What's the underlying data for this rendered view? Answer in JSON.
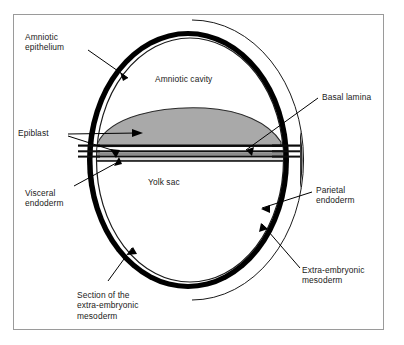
{
  "figure": {
    "kind": "biological-cross-section-diagram",
    "frame": {
      "border_color": "#9a9a9a",
      "background": "#ffffff"
    }
  },
  "colors": {
    "background": "#ffffff",
    "outline": "#000000",
    "mesoderm_hatch_dark": "#4a4a4a",
    "mesoderm_hatch_light": "#6e6e6e",
    "ring_black": "#000000",
    "ring_white": "#ffffff",
    "epiblast_gray": "#a9a9a9",
    "layer_mid_gray": "#8c8c8c",
    "label_text": "#1a1a1a",
    "leader_line": "#000000"
  },
  "interior_labels": [
    {
      "id": "amniotic-cavity",
      "text": "Amniotic cavity"
    },
    {
      "id": "yolk-sac",
      "text": "Yolk sac"
    }
  ],
  "callouts": [
    {
      "id": "amniotic-epithelium",
      "text": "Amniotic\nepithelium",
      "side": "left",
      "target": "black ring, upper-left of sphere"
    },
    {
      "id": "epiblast",
      "text": "Epiblast",
      "side": "left",
      "target": "gray lens-shaped disc across sphere midline"
    },
    {
      "id": "visceral-endoderm",
      "text": "Visceral\nendoderm",
      "side": "left",
      "target": "thin layer beneath epiblast disc"
    },
    {
      "id": "section-of-extra-embryonic-mesoderm",
      "text": "Section of the\nextra-embryonic\nmesoderm",
      "side": "bottom-left",
      "target": "cut face of outer mesoderm at lower-left of sphere"
    },
    {
      "id": "basal-lamina",
      "text": "Basal lamina",
      "side": "right",
      "target": "thin line at right edge of epiblast disc"
    },
    {
      "id": "parietal-endoderm",
      "text": "Parietal\nendoderm",
      "side": "right",
      "target": "black ring, lower-right of sphere"
    },
    {
      "id": "extra-embryonic-mesoderm",
      "text": "Extra-embryonic\nmesoderm",
      "side": "bottom-right",
      "target": "hatched outer crescent layer"
    }
  ]
}
